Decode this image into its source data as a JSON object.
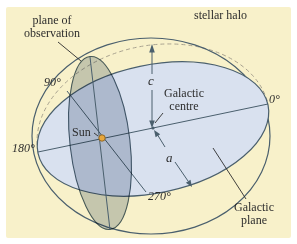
{
  "figure": {
    "colors": {
      "page": "#ffffff",
      "background": "#F8F1CA",
      "plane_fill": "#D9E1EF",
      "observation_fill": "#CBD2DB",
      "line": "#4A5F6D",
      "dashed": "#A9A390",
      "sun_fill": "#E8A73C",
      "sun_stroke": "#8A6120",
      "text": "#2D2D2D"
    },
    "labels": {
      "plane_of_observation": {
        "line1": "plane of",
        "line2": "observation"
      },
      "stellar_halo": "stellar halo",
      "deg_90": "90°",
      "deg_0": "0°",
      "deg_180": "180°",
      "deg_270": "270°",
      "sun": "Sun",
      "galactic_centre": {
        "line1": "Galactic",
        "line2": "centre"
      },
      "galactic_plane": {
        "line1": "Galactic",
        "line2": "plane"
      },
      "semi_minor_axis": "c",
      "semi_major_axis": "a"
    }
  }
}
